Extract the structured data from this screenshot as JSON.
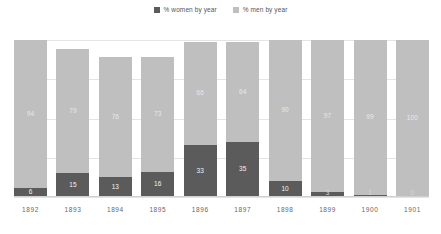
{
  "legend": {
    "position": "top-center",
    "entries": [
      {
        "label": "% women by year",
        "color": "#5b5b5b",
        "swatch_name": "legend-swatch-women"
      },
      {
        "label": "% men by year",
        "color": "#bfbfbf",
        "swatch_name": "legend-swatch-men"
      }
    ]
  },
  "colors": {
    "women": "#5b5b5b",
    "men": "#bfbfbf",
    "gridline": "#e4e4e4",
    "axis": "#d0d0d0",
    "tick_text": "#666666",
    "legend_text": "#555555"
  },
  "chart_data": {
    "type": "bar",
    "stacked": true,
    "title": "",
    "subtitle": "",
    "xlabel": "",
    "ylabel": "",
    "grid": true,
    "legend_position": "top-center",
    "ylim": [
      0,
      100
    ],
    "categories": [
      "1892",
      "1893",
      "1894",
      "1895",
      "1896",
      "1897",
      "1898",
      "1899",
      "1900",
      "1901"
    ],
    "series": [
      {
        "name": "% men by year",
        "color": "#bfbfbf",
        "values": [
          94,
          79,
          76,
          73,
          66,
          64,
          90,
          97,
          99,
          100
        ]
      },
      {
        "name": "% women by year",
        "color": "#5b5b5b",
        "values": [
          6,
          15,
          13,
          16,
          33,
          35,
          10,
          3,
          1,
          0
        ]
      }
    ],
    "bar_totals": [
      100,
      94,
      89,
      89,
      99,
      99,
      100,
      100,
      100,
      100
    ]
  },
  "bars": [
    {
      "year": "1892",
      "men": 94,
      "women": 6,
      "men_label": "94",
      "women_label": "6",
      "total": 100
    },
    {
      "year": "1893",
      "men": 79,
      "women": 15,
      "men_label": "79",
      "women_label": "15",
      "total": 94
    },
    {
      "year": "1894",
      "men": 76,
      "women": 13,
      "men_label": "76",
      "women_label": "13",
      "total": 89
    },
    {
      "year": "1895",
      "men": 73,
      "women": 16,
      "men_label": "73",
      "women_label": "16",
      "total": 89
    },
    {
      "year": "1896",
      "men": 66,
      "women": 33,
      "men_label": "66",
      "women_label": "33",
      "total": 99
    },
    {
      "year": "1897",
      "men": 64,
      "women": 35,
      "men_label": "64",
      "women_label": "35",
      "total": 99
    },
    {
      "year": "1898",
      "men": 90,
      "women": 10,
      "men_label": "90",
      "women_label": "10",
      "total": 100
    },
    {
      "year": "1899",
      "men": 97,
      "women": 3,
      "men_label": "97",
      "women_label": "3",
      "total": 100
    },
    {
      "year": "1900",
      "men": 99,
      "women": 1,
      "men_label": "99",
      "women_label": "1",
      "total": 100
    },
    {
      "year": "1901",
      "men": 100,
      "women": 0,
      "men_label": "100",
      "women_label": "0",
      "total": 100
    }
  ],
  "gridlines": [
    0,
    25,
    50,
    75,
    100
  ]
}
